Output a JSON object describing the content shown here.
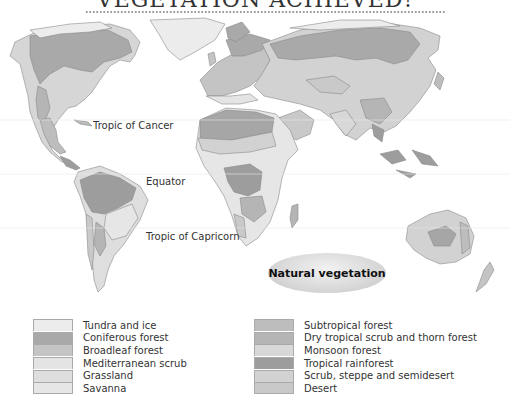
{
  "title": "VEGETATION ACHIEVED!",
  "map": {
    "labels": {
      "tropic_cancer": "Tropic of Cancer",
      "equator": "Equator",
      "tropic_capricorn": "Tropic of Capricorn"
    },
    "badge": "Natural vegetation"
  },
  "legend": {
    "left": [
      {
        "label": "Tundra and ice",
        "color": "#ececec"
      },
      {
        "label": "Coniferous forest",
        "color": "#a9a9a9"
      },
      {
        "label": "Broadleaf forest",
        "color": "#c4c4c4"
      },
      {
        "label": "Mediterranean scrub",
        "color": "#e4e4e4"
      },
      {
        "label": "Grassland",
        "color": "#dedede"
      },
      {
        "label": "Savanna",
        "color": "#e6e6e6"
      }
    ],
    "right": [
      {
        "label": "Subtropical forest",
        "color": "#bdbdbd"
      },
      {
        "label": "Dry tropical scrub and thorn forest",
        "color": "#b5b5b5"
      },
      {
        "label": "Monsoon forest",
        "color": "#d8d8d8"
      },
      {
        "label": "Tropical rainforest",
        "color": "#9d9d9d"
      },
      {
        "label": "Scrub, steppe and semidesert",
        "color": "#d2d2d2"
      },
      {
        "label": "Desert",
        "color": "#c9c9c9"
      }
    ]
  },
  "colors": {
    "tundra": "#ececec",
    "coniferous": "#a9a9a9",
    "broadleaf": "#c4c4c4",
    "grassland": "#dedede",
    "savanna": "#e6e6e6",
    "rainforest": "#9d9d9d",
    "desert": "#a6a6a6",
    "steppe": "#d2d2d2",
    "outline": "#8a8a8a"
  }
}
